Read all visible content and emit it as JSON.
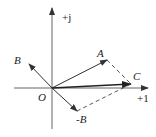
{
  "diagram": {
    "type": "phasor-diagram",
    "axes": {
      "horizontal_label": "+1",
      "vertical_label": "+j",
      "origin_label": "O"
    },
    "vectors": [
      {
        "name": "A",
        "label": "A",
        "style": "solid"
      },
      {
        "name": "B",
        "label": "B",
        "style": "solid"
      },
      {
        "name": "-B",
        "label": "-B",
        "style": "solid"
      },
      {
        "name": "C",
        "label": "C",
        "style": "solid-bold"
      }
    ],
    "construction_lines": [
      {
        "from": "A",
        "to": "C",
        "style": "dashed"
      },
      {
        "from": "-B",
        "to": "C",
        "style": "dashed"
      }
    ],
    "colors": {
      "line": "#333333",
      "background": "#ffffff"
    }
  }
}
